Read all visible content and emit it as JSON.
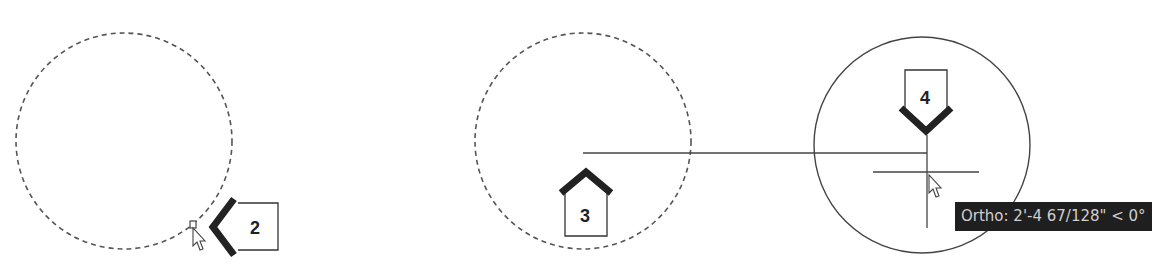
{
  "figure": {
    "top_clipped_text": "",
    "circles": [
      {
        "id": "original",
        "cx": 124,
        "cy": 141,
        "r": 108,
        "style": "dashed"
      },
      {
        "id": "copy-preview",
        "cx": 583,
        "cy": 141,
        "r": 108,
        "style": "dashed"
      },
      {
        "id": "placed-copy",
        "cx": 922,
        "cy": 145,
        "r": 108,
        "style": "solid"
      }
    ],
    "callouts": [
      {
        "number": "2",
        "direction": "left"
      },
      {
        "number": "3",
        "direction": "up"
      },
      {
        "number": "4",
        "direction": "down"
      }
    ],
    "tooltip": {
      "text": "Ortho: 2'-4 67/128\" < 0°"
    },
    "colors": {
      "dashed": "#555555",
      "solid": "#333333",
      "tooltip_bg": "#1f1f1f",
      "tooltip_text": "#cfcfcf"
    }
  }
}
